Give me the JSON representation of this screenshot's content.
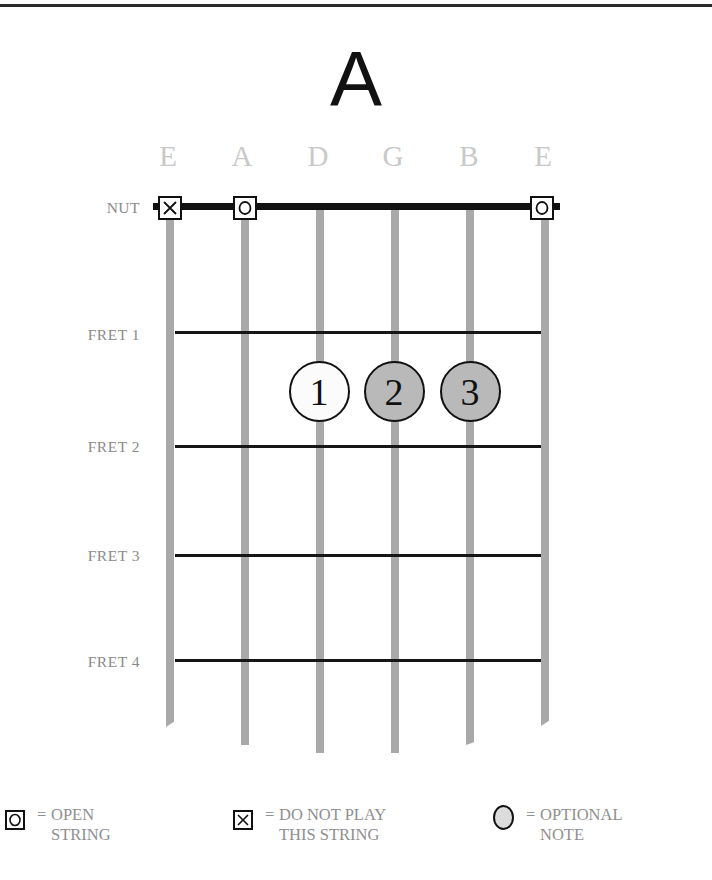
{
  "chord": {
    "title": "A"
  },
  "strings": [
    {
      "name": "E",
      "x": 170,
      "bottom": 727,
      "marker": "x"
    },
    {
      "name": "A",
      "x": 245,
      "bottom": 745,
      "marker": "o"
    },
    {
      "name": "D",
      "x": 320,
      "bottom": 753,
      "marker": null
    },
    {
      "name": "G",
      "x": 395,
      "bottom": 753,
      "marker": null
    },
    {
      "name": "B",
      "x": 470,
      "bottom": 745,
      "marker": null
    },
    {
      "name": "E",
      "x": 545,
      "bottom": 726,
      "marker": "o"
    }
  ],
  "rows": {
    "nut": {
      "label": "NUT",
      "y": 209
    },
    "frets": [
      {
        "label": "FRET 1",
        "y": 332
      },
      {
        "label": "FRET 2",
        "y": 446
      },
      {
        "label": "FRET 3",
        "y": 555
      },
      {
        "label": "FRET 4",
        "y": 660
      }
    ]
  },
  "fingers": [
    {
      "number": "1",
      "string": "D",
      "between_frets": "1-2",
      "type": "normal",
      "x": 319
    },
    {
      "number": "2",
      "string": "G",
      "between_frets": "1-2",
      "type": "optional",
      "x": 394
    },
    {
      "number": "3",
      "string": "B",
      "between_frets": "1-2",
      "type": "optional",
      "x": 470
    }
  ],
  "legend": {
    "open": {
      "equals": "=",
      "line1": "OPEN",
      "line2": "STRING"
    },
    "mute": {
      "equals": "=",
      "line1": "DO NOT PLAY",
      "line2": "THIS STRING"
    },
    "optional": {
      "equals": "=",
      "line1": "OPTIONAL",
      "line2": "NOTE"
    }
  },
  "colors": {
    "string": "#a9a9a9",
    "fret": "#161616",
    "nut": "#111111",
    "optional_fill": "#b9b9b9",
    "legend_optional_fill": "#dcdcdc",
    "label_gray": "#8a8a8a",
    "string_label": "#c9c9c9"
  }
}
